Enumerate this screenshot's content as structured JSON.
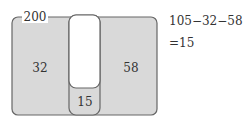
{
  "diagram": {
    "total_label": "200",
    "left_region_value": "32",
    "right_region_value": "58",
    "overlap_bottom_value": "15",
    "colors": {
      "fill": "#d9d9d9",
      "stroke": "#666666",
      "inner_blank": "#ffffff"
    }
  },
  "equation": {
    "line1": "105−32−58",
    "line2": "=15"
  }
}
